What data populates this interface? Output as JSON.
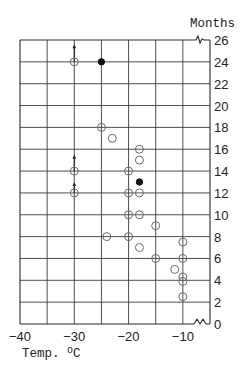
{
  "chart_data": {
    "type": "scatter",
    "title": "",
    "xlabel": "Temp. °C",
    "ylabel": "Months",
    "xlim": [
      -40,
      -5
    ],
    "ylim": [
      0,
      26
    ],
    "x_ticks": [
      -40,
      -30,
      -20,
      -10
    ],
    "x_tick_labels": [
      "−40",
      "−30",
      "−20",
      "−10"
    ],
    "x_grid": [
      -35,
      -30,
      -25,
      -20,
      -15,
      -10
    ],
    "y_ticks": [
      0,
      2,
      4,
      6,
      8,
      10,
      12,
      14,
      16,
      18,
      20,
      22,
      24,
      26
    ],
    "y_tick_labels": [
      "0",
      "2",
      "4",
      "6",
      "8",
      "10",
      "12",
      "14",
      "16",
      "18",
      "20",
      "22",
      "24",
      "26"
    ],
    "y_axis_position": "right",
    "grid": true,
    "axis_breaks": [
      "top-right",
      "bottom-right"
    ],
    "legend": null,
    "series": [
      {
        "name": "open circles",
        "marker": "open",
        "points": [
          {
            "x": -30,
            "y": 24,
            "arrow_to": 25.6
          },
          {
            "x": -25,
            "y": 18
          },
          {
            "x": -23,
            "y": 17
          },
          {
            "x": -18,
            "y": 16
          },
          {
            "x": -18,
            "y": 15
          },
          {
            "x": -30,
            "y": 14,
            "arrow_to": 15.5
          },
          {
            "x": -20,
            "y": 14
          },
          {
            "x": -30,
            "y": 12,
            "arrow_to": 13.0
          },
          {
            "x": -20,
            "y": 12
          },
          {
            "x": -18,
            "y": 12
          },
          {
            "x": -20,
            "y": 10
          },
          {
            "x": -18,
            "y": 10
          },
          {
            "x": -15,
            "y": 9
          },
          {
            "x": -24,
            "y": 8
          },
          {
            "x": -20,
            "y": 8
          },
          {
            "x": -10,
            "y": 7.5
          },
          {
            "x": -18,
            "y": 7
          },
          {
            "x": -15,
            "y": 6
          },
          {
            "x": -10,
            "y": 6
          },
          {
            "x": -11.5,
            "y": 5
          },
          {
            "x": -10,
            "y": 4.3
          },
          {
            "x": -10,
            "y": 3.9
          },
          {
            "x": -10,
            "y": 2.5
          }
        ]
      },
      {
        "name": "filled circles",
        "marker": "filled",
        "points": [
          {
            "x": -25,
            "y": 24
          },
          {
            "x": -18,
            "y": 13
          }
        ]
      }
    ]
  },
  "layout": {
    "plot_left_px": 20,
    "plot_right_px": 210,
    "plot_top_px": 40,
    "plot_bottom_px": 324
  }
}
